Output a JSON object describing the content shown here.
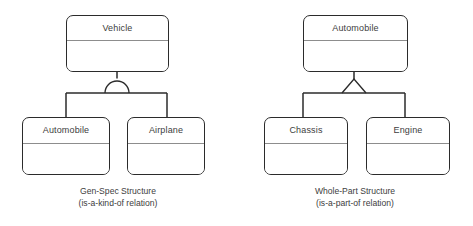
{
  "page": {
    "background_color": "#ffffff",
    "line_color": "#2b2b2b",
    "divider_color": "#8d8d8d",
    "text_color": "#3d3d3d"
  },
  "diagrams": [
    {
      "id": "gen-spec",
      "connector_type": "semicircle",
      "parent": {
        "name": "Vehicle"
      },
      "children": [
        {
          "name": "Automobile"
        },
        {
          "name": "Airplane"
        }
      ],
      "caption": {
        "title": "Gen-Spec Structure",
        "subtitle": "(is-a-kind-of relation)"
      }
    },
    {
      "id": "whole-part",
      "connector_type": "triangle",
      "parent": {
        "name": "Automobile"
      },
      "children": [
        {
          "name": "Chassis"
        },
        {
          "name": "Engine"
        }
      ],
      "caption": {
        "title": "Whole-Part Structure",
        "subtitle": "(is-a-part-of relation)"
      }
    }
  ]
}
